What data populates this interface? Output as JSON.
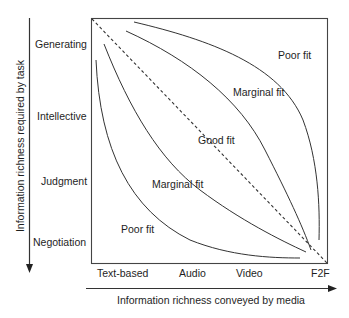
{
  "diagram": {
    "y_axis": {
      "title": "Information richness required by task",
      "levels": [
        "Generating",
        "Intellective",
        "Judgment",
        "Negotiation"
      ]
    },
    "x_axis": {
      "title": "Information richness conveyed by media",
      "levels": [
        "Text-based",
        "Audio",
        "Video",
        "F2F"
      ]
    },
    "regions": {
      "poor_fit_upper": "Poor fit",
      "marginal_fit_upper": "Marginal fit",
      "good_fit": "Good fit",
      "marginal_fit_lower": "Marginal fit",
      "poor_fit_lower": "Poor fit"
    },
    "colors": {
      "line": "#333333",
      "text": "#1e1e1e",
      "background": "#ffffff"
    }
  }
}
